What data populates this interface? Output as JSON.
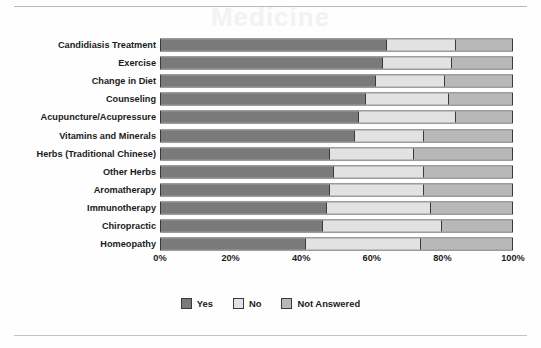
{
  "figure": {
    "ghost_text": "Medicine"
  },
  "chart_data": {
    "type": "bar",
    "orientation": "horizontal",
    "stacked": true,
    "normalized": true,
    "title": "",
    "subtitle": "",
    "xlabel": "",
    "ylabel": "",
    "xlim": [
      0,
      100
    ],
    "xtick_labels": [
      "0%",
      "20%",
      "40%",
      "60%",
      "80%",
      "100%"
    ],
    "xtick_values": [
      0,
      20,
      40,
      60,
      80,
      100
    ],
    "grid": false,
    "legend_position": "bottom-center",
    "legend": [
      "Yes",
      "No",
      "Not Answered"
    ],
    "colors": {
      "Yes": "#7a7a7a",
      "No": "#e2e2e2",
      "Not Answered": "#b8b8b8"
    },
    "categories": [
      "Candidiasis Treatment",
      "Exercise",
      "Change in Diet",
      "Counseling",
      "Acupuncture/Acupressure",
      "Vitamins and Minerals",
      "Herbs (Traditional Chinese)",
      "Other Herbs",
      "Aromatherapy",
      "Immunotherapy",
      "Chiropractic",
      "Homeopathy"
    ],
    "series": [
      {
        "name": "Yes",
        "values": [
          64,
          63,
          61,
          58,
          56,
          55,
          48,
          49,
          48,
          47,
          46,
          41
        ]
      },
      {
        "name": "No",
        "values": [
          20,
          20,
          20,
          24,
          28,
          20,
          24,
          26,
          27,
          30,
          34,
          33
        ]
      },
      {
        "name": "Not Answered",
        "values": [
          16,
          17,
          19,
          18,
          16,
          25,
          28,
          25,
          25,
          23,
          20,
          26
        ]
      }
    ]
  }
}
